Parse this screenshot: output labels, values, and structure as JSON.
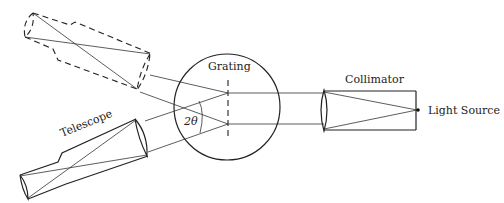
{
  "diagram": {
    "labels": {
      "grating": "Grating",
      "collimator": "Collimator",
      "light_source": "Light Source",
      "telescope": "Telescope",
      "angle": "2θ"
    }
  }
}
